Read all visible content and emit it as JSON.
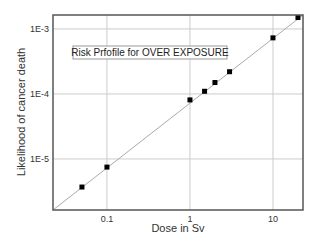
{
  "chart_data": {
    "type": "scatter",
    "title": "Risk Prfofile for OVER EXPOSURE",
    "xlabel": "Dose in Sv",
    "ylabel": "Likelihood of cancer death",
    "xscale": "log",
    "yscale": "log",
    "xlim": [
      0.0224,
      23
    ],
    "ylim": [
      1.64e-06,
      0.00164
    ],
    "x_ticks": [
      0.1,
      1,
      10
    ],
    "x_tick_labels": [
      "0.1",
      "1",
      "10"
    ],
    "y_ticks": [
      1e-05,
      0.0001,
      0.001
    ],
    "y_tick_labels": [
      "1E-5",
      "1E-4",
      "1E-3"
    ],
    "grid": true,
    "legend": null,
    "series": [
      {
        "name": "data points",
        "marker": "square",
        "x": [
          0.05,
          0.1,
          1,
          1.5,
          2,
          3,
          10,
          20
        ],
        "y": [
          3.7e-06,
          7.5e-06,
          8.1e-05,
          0.00011,
          0.00015,
          0.00022,
          0.00073,
          0.0015
        ]
      },
      {
        "name": "linear fit",
        "style": "line",
        "x": [
          0.0224,
          23
        ],
        "y": [
          1.64e-06,
          0.0017
        ]
      }
    ]
  },
  "colors": {
    "frame": "#555555",
    "grid": "#cccccc",
    "line": "#aaaaaa",
    "marker": "#000000"
  }
}
